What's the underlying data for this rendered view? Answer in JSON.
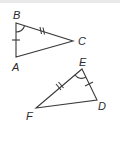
{
  "diagram": {
    "triangles": [
      {
        "name": "ABC",
        "vertices": [
          {
            "label": "B",
            "x": 16,
            "y": 23
          },
          {
            "label": "A",
            "x": 16,
            "y": 57
          },
          {
            "label": "C",
            "x": 73,
            "y": 41
          }
        ],
        "marks": {
          "BA": "single-tick",
          "BC": "double-tick",
          "angle_B": "arc"
        }
      },
      {
        "name": "EDF",
        "vertices": [
          {
            "label": "E",
            "x": 82,
            "y": 69
          },
          {
            "label": "D",
            "x": 97,
            "y": 100
          },
          {
            "label": "F",
            "x": 36,
            "y": 108
          }
        ],
        "marks": {
          "ED": "single-tick",
          "EF": "double-tick",
          "angle_E": "arc"
        }
      }
    ],
    "labels": {
      "B": "B",
      "A": "A",
      "C": "C",
      "E": "E",
      "D": "D",
      "F": "F"
    },
    "colors": {
      "stroke": "#3a3a3a",
      "text": "#2b2b2b",
      "background": "#ffffff"
    }
  }
}
